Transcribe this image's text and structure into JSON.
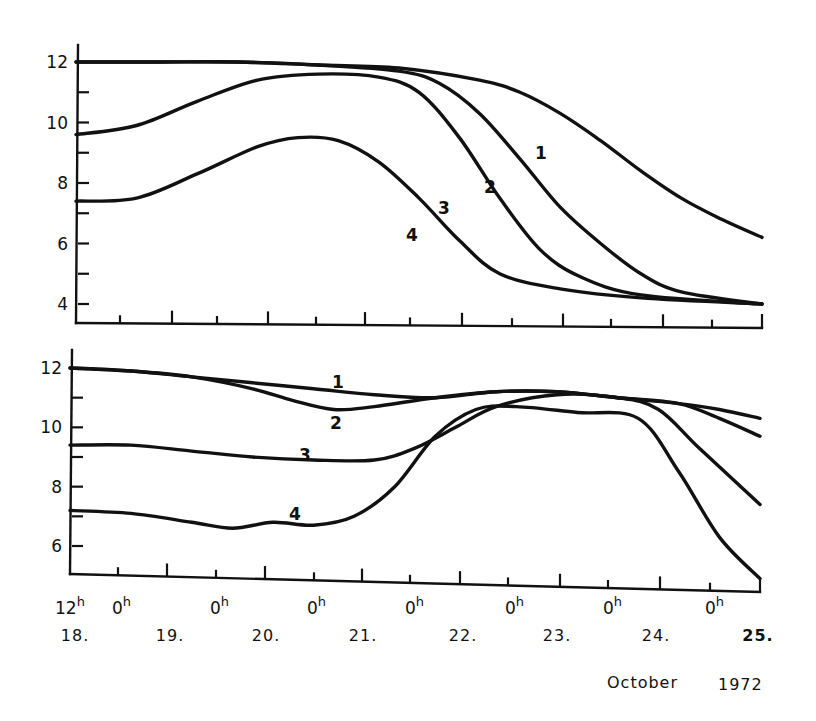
{
  "chart_data": [
    {
      "type": "line",
      "panel": "upper",
      "title": "",
      "xlabel": "October 1972",
      "ylabel": "",
      "x_unit": "hours since 18 Oct 12h",
      "xlim": [
        0,
        170
      ],
      "ylim": [
        3.5,
        12.5
      ],
      "yticks": [
        4,
        6,
        8,
        10,
        12
      ],
      "yminor": [
        5,
        7,
        9,
        11
      ],
      "grid": false,
      "series": [
        {
          "name": "1",
          "label_at": [
            541,
            153
          ],
          "x": [
            0,
            20,
            40,
            60,
            80,
            100,
            110,
            120,
            130,
            140,
            150,
            160,
            170
          ],
          "y": [
            12.0,
            12.0,
            12.0,
            11.9,
            11.8,
            11.4,
            11.0,
            10.3,
            9.4,
            8.4,
            7.5,
            6.8,
            6.2
          ]
        },
        {
          "name": "2",
          "label_at": [
            490,
            187
          ],
          "x": [
            0,
            20,
            40,
            60,
            80,
            90,
            100,
            110,
            120,
            130,
            140,
            150,
            170
          ],
          "y": [
            12.0,
            12.0,
            12.0,
            11.9,
            11.7,
            11.3,
            10.3,
            8.8,
            7.2,
            6.0,
            5.0,
            4.4,
            4.0
          ]
        },
        {
          "name": "3",
          "label_at": [
            444,
            208
          ],
          "x": [
            0,
            15,
            30,
            45,
            60,
            75,
            85,
            95,
            105,
            115,
            125,
            140,
            170
          ],
          "y": [
            9.6,
            9.9,
            10.7,
            11.4,
            11.6,
            11.5,
            11.0,
            9.5,
            7.5,
            5.8,
            4.9,
            4.3,
            4.0
          ]
        },
        {
          "name": "4",
          "label_at": [
            412,
            235
          ],
          "x": [
            0,
            15,
            30,
            45,
            55,
            65,
            75,
            85,
            95,
            105,
            120,
            140,
            170
          ],
          "y": [
            7.4,
            7.5,
            8.3,
            9.2,
            9.5,
            9.4,
            8.7,
            7.5,
            6.1,
            5.0,
            4.5,
            4.2,
            4.0
          ]
        }
      ]
    },
    {
      "type": "line",
      "panel": "lower",
      "title": "",
      "xlabel": "October 1972",
      "ylabel": "",
      "x_unit": "hours since 18 Oct 12h",
      "xlim": [
        0,
        170
      ],
      "ylim": [
        5.0,
        12.5
      ],
      "yticks": [
        6,
        8,
        10,
        12
      ],
      "yminor": [
        7,
        9,
        11
      ],
      "grid": false,
      "series": [
        {
          "name": "1",
          "label_at": [
            338,
            382
          ],
          "x": [
            0,
            15,
            30,
            45,
            60,
            75,
            90,
            105,
            120,
            135,
            150,
            160,
            170
          ],
          "y": [
            12.0,
            11.9,
            11.7,
            11.5,
            11.3,
            11.1,
            11.0,
            11.2,
            11.2,
            11.0,
            10.8,
            10.6,
            10.3
          ]
        },
        {
          "name": "2",
          "label_at": [
            336,
            423
          ],
          "x": [
            0,
            15,
            30,
            45,
            55,
            65,
            75,
            90,
            105,
            120,
            135,
            150,
            160,
            170
          ],
          "y": [
            12.0,
            11.9,
            11.7,
            11.3,
            10.9,
            10.6,
            10.7,
            11.0,
            11.2,
            11.2,
            11.0,
            10.8,
            10.3,
            9.7
          ]
        },
        {
          "name": "3",
          "label_at": [
            305,
            455
          ],
          "x": [
            0,
            15,
            30,
            45,
            60,
            75,
            85,
            95,
            105,
            120,
            135,
            145,
            155,
            170
          ],
          "y": [
            9.4,
            9.4,
            9.2,
            9.0,
            8.9,
            8.9,
            9.3,
            10.0,
            10.7,
            11.1,
            11.0,
            10.6,
            9.3,
            7.4
          ]
        },
        {
          "name": "4",
          "label_at": [
            295,
            514
          ],
          "x": [
            0,
            15,
            30,
            40,
            50,
            60,
            70,
            80,
            90,
            100,
            110,
            125,
            140,
            150,
            160,
            170
          ],
          "y": [
            7.2,
            7.1,
            6.8,
            6.6,
            6.8,
            6.7,
            7.0,
            8.0,
            9.7,
            10.6,
            10.7,
            10.5,
            10.3,
            8.5,
            6.3,
            4.9
          ]
        }
      ]
    }
  ],
  "x_axis": {
    "hour_labels": [
      {
        "text": "12",
        "sup": "h",
        "x": 55
      },
      {
        "text": "0",
        "sup": "h",
        "x": 112
      },
      {
        "text": "0",
        "sup": "h",
        "x": 210
      },
      {
        "text": "0",
        "sup": "h",
        "x": 307
      },
      {
        "text": "0",
        "sup": "h",
        "x": 405
      },
      {
        "text": "0",
        "sup": "h",
        "x": 505
      },
      {
        "text": "0",
        "sup": "h",
        "x": 603
      },
      {
        "text": "0",
        "sup": "h",
        "x": 705
      }
    ],
    "day_labels": [
      {
        "text": "18.",
        "x": 75,
        "bold": false
      },
      {
        "text": "19.",
        "x": 170,
        "bold": false
      },
      {
        "text": "20.",
        "x": 266,
        "bold": false
      },
      {
        "text": "21.",
        "x": 363,
        "bold": false
      },
      {
        "text": "22.",
        "x": 463,
        "bold": false
      },
      {
        "text": "23.",
        "x": 557,
        "bold": false
      },
      {
        "text": "24.",
        "x": 656,
        "bold": false
      },
      {
        "text": "25.",
        "x": 758,
        "bold": true
      }
    ],
    "caption_month": "October",
    "caption_year": "1972"
  }
}
